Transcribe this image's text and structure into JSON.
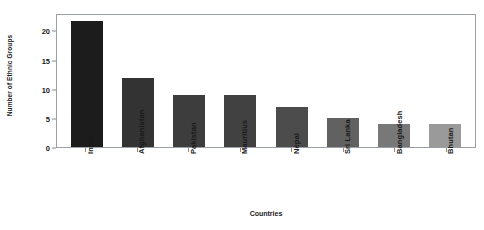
{
  "chart_data": {
    "type": "bar",
    "title": "",
    "xlabel": "Countries",
    "ylabel": "Number of Ethnic Groups",
    "categories": [
      "India",
      "Afghanistan",
      "Pakistan",
      "Mauritius",
      "Nepal",
      "Sri Lanka",
      "Bangladesh",
      "Bhutan"
    ],
    "values": [
      22,
      12,
      9,
      9,
      7,
      5,
      4,
      4
    ],
    "bar_colors": [
      "#1c1c1c",
      "#333333",
      "#3d3d3d",
      "#414141",
      "#4c4c4c",
      "#616161",
      "#787878",
      "#9a9a9a"
    ],
    "ylim": [
      0,
      23
    ],
    "yticks": [
      0,
      5,
      10,
      15,
      20
    ],
    "ytick_labels": [
      "0",
      "5",
      "10",
      "15",
      "20"
    ],
    "grid": false,
    "legend": "none",
    "xtick_rotation": -90,
    "frame_color": "#9aa0a6",
    "background": "#ffffff"
  }
}
